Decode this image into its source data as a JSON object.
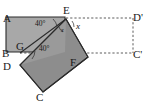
{
  "figure": {
    "type": "geometry-diagram",
    "canvas": {
      "width": 147,
      "height": 104,
      "background": "#ffffff"
    },
    "colors": {
      "light_rect_fill": "#a8a8a8",
      "dark_rect_fill": "#8d8d8d",
      "outline": "#2b2b2b",
      "dashed_line": "#4a4a4a",
      "label_text": "#1a1a1a"
    },
    "vertex_labels": [
      {
        "id": "A",
        "text": "A",
        "x": 3,
        "y": 22
      },
      {
        "id": "E",
        "text": "E",
        "x": 66,
        "y": 14
      },
      {
        "id": "Dp",
        "text": "D'",
        "x": 134,
        "y": 21
      },
      {
        "id": "B",
        "text": "B",
        "x": 3,
        "y": 57
      },
      {
        "id": "G",
        "text": "G",
        "x": 17,
        "y": 49
      },
      {
        "id": "Cp",
        "text": "C'",
        "x": 134,
        "y": 57
      },
      {
        "id": "D",
        "text": "D",
        "x": 4,
        "y": 70
      },
      {
        "id": "F",
        "text": "F",
        "x": 70,
        "y": 66
      },
      {
        "id": "C",
        "text": "C",
        "x": 37,
        "y": 99
      }
    ],
    "angle_labels": [
      {
        "id": "angle-upper",
        "text": "40°",
        "x": 36,
        "y": 25
      },
      {
        "id": "angle-lower",
        "text": "40°",
        "x": 40,
        "y": 49
      }
    ],
    "unknown_labels": [
      {
        "id": "x-exterior",
        "text": "x",
        "x": 76,
        "y": 28
      },
      {
        "id": "x-interior",
        "text": "x",
        "x": 61,
        "y": 31
      }
    ],
    "shapes": {
      "light_rect_points": "6,17 65,17 65,52 6,52",
      "dark_rect_points": "66,19 88,57 43,92 20,65",
      "overlap_wedge_points": "66,19 65,52 20,65"
    },
    "dashed_segments": [
      {
        "id": "top-dashed",
        "x1": 66,
        "y1": 18,
        "x2": 133,
        "y2": 18
      },
      {
        "id": "right-dashed",
        "x1": 133,
        "y1": 18,
        "x2": 133,
        "y2": 53
      },
      {
        "id": "bottom-dashed",
        "x1": 66,
        "y1": 53,
        "x2": 133,
        "y2": 53
      },
      {
        "id": "gf-dashed",
        "x1": 20,
        "y1": 53,
        "x2": 66,
        "y2": 53
      }
    ],
    "angle_arcs": [
      {
        "id": "arc-upper",
        "d": "M 52,19 A 15,15 0 0 1 56,26"
      },
      {
        "id": "arc-lower",
        "d": "M 31,58 A 14,14 0 0 0 34,51"
      },
      {
        "id": "arc-x-exterior",
        "d": "M 73,20 A 9,9 0 0 1 75,26"
      },
      {
        "id": "arc-x-interior",
        "d": "M 60,26 A 8,8 0 0 0 64,32"
      }
    ]
  }
}
